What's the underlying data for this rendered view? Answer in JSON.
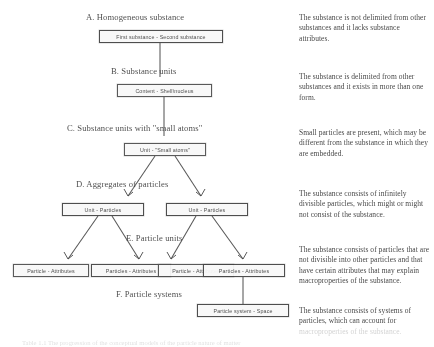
{
  "figure": {
    "caption": "Table 1.1 The progression of the conceptual models of the particle nature of matter",
    "sections": [
      {
        "id": "A",
        "label": "A. Homogeneous substance"
      },
      {
        "id": "B",
        "label": "B. Substance units"
      },
      {
        "id": "C",
        "label": "C. Substance units with \"small atoms\""
      },
      {
        "id": "D",
        "label": "D. Aggregates of particles"
      },
      {
        "id": "E",
        "label": "E. Particle units"
      },
      {
        "id": "F",
        "label": "F. Particle systems"
      }
    ],
    "nodes": [
      {
        "id": "n-a",
        "label": "First substance - Second substance"
      },
      {
        "id": "n-b",
        "label": "Content - Shell\\nucleus"
      },
      {
        "id": "n-c",
        "label": "Unit - \"Small atoms\""
      },
      {
        "id": "n-d1",
        "label": "Unit - Particles"
      },
      {
        "id": "n-d2",
        "label": "Unit - Particles"
      },
      {
        "id": "n-e1",
        "label": "Particle - Attributes"
      },
      {
        "id": "n-e2",
        "label": "Particles - Attributes"
      },
      {
        "id": "n-e3",
        "label": "Particle - Attributes"
      },
      {
        "id": "n-e4",
        "label": "Particles - Attributes"
      },
      {
        "id": "n-f1",
        "label": "Particle system - Space"
      }
    ],
    "notes": [
      {
        "id": "note-a",
        "text": "The substance is not delimited from other substances and it lacks substance attributes."
      },
      {
        "id": "note-b",
        "text": "The substance is delimited from other substances and it exists in more than one form."
      },
      {
        "id": "note-c",
        "text": "Small particles are present, which may be different from the substance in which they are embedded."
      },
      {
        "id": "note-d",
        "text": "The substance consists of infinitely divisible particles, which might or might not consist of the substance."
      },
      {
        "id": "note-e",
        "text": "The substance consists of particles that are not divisible into other particles and that have certain attributes that may explain macroproperties of the substance."
      },
      {
        "id": "note-f",
        "text": "The substance consists of systems of particles, which can account for",
        "faded_tail": "macroproperties of the substance."
      }
    ]
  }
}
